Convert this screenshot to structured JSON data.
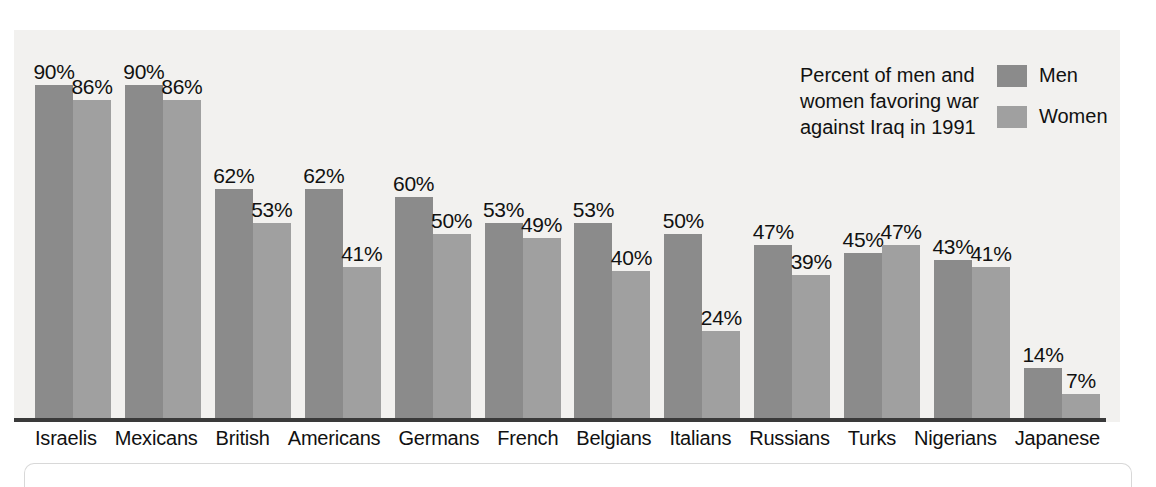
{
  "legend": {
    "caption_lines": [
      "Percent of men and",
      "women favoring war",
      "against Iraq in 1991"
    ],
    "men_label": "Men",
    "women_label": "Women"
  },
  "colors": {
    "men": "#8b8b8b",
    "women": "#a0a0a0",
    "plot_background": "#f2f1ef",
    "axis": "#3a3a3a",
    "text": "#111111"
  },
  "chart_data": {
    "type": "bar",
    "title": "Percent of men and women favoring war against Iraq in 1991",
    "xlabel": "",
    "ylabel": "",
    "ylim": [
      0,
      100
    ],
    "grid": false,
    "legend_position": "top-right",
    "value_suffix": "%",
    "categories": [
      "Israelis",
      "Mexicans",
      "British",
      "Americans",
      "Germans",
      "French",
      "Belgians",
      "Italians",
      "Russians",
      "Turks",
      "Nigerians",
      "Japanese"
    ],
    "series": [
      {
        "name": "Men",
        "color": "#8b8b8b",
        "values": [
          90,
          90,
          62,
          62,
          60,
          53,
          53,
          50,
          47,
          45,
          43,
          14
        ],
        "labels": [
          "90%",
          "90%",
          "62%",
          "62%",
          "60%",
          "53%",
          "53%",
          "50%",
          "47%",
          "45%",
          "43%",
          "14%"
        ]
      },
      {
        "name": "Women",
        "color": "#a0a0a0",
        "values": [
          86,
          86,
          53,
          41,
          50,
          49,
          40,
          24,
          39,
          47,
          41,
          7
        ],
        "labels": [
          "86%",
          "86%",
          "53%",
          "41%",
          "50%",
          "49%",
          "40%",
          "24%",
          "39%",
          "47%",
          "41%",
          "7%"
        ]
      }
    ]
  }
}
